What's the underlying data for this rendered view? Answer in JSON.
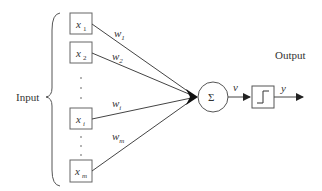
{
  "input_label": "Input",
  "output_label": "Output",
  "inputs": [
    {
      "name": "x",
      "sub": "1",
      "weight": "w",
      "wsub": "1"
    },
    {
      "name": "x",
      "sub": "2",
      "weight": "w",
      "wsub": "2"
    },
    {
      "name": "x",
      "sub": "i",
      "weight": "w",
      "wsub": "i"
    },
    {
      "name": "x",
      "sub": "m",
      "weight": "w",
      "wsub": "m"
    }
  ],
  "summation_symbol": "Σ",
  "v_label": "v",
  "y_label": "y",
  "colors": {
    "stroke": "#555555",
    "text": "#333333"
  }
}
